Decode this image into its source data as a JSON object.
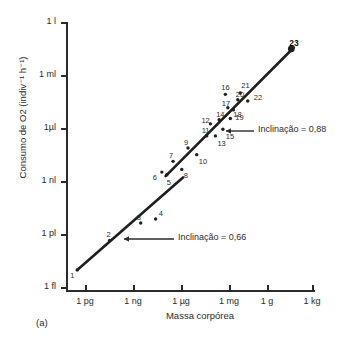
{
  "panel": {
    "label": "(a)"
  },
  "chart_data": {
    "type": "scatter",
    "title": "",
    "xlabel": "Massa corpórea",
    "ylabel": "Consumo de O2 (indiv⁻¹ h⁻¹)",
    "xscale": "log",
    "yscale": "log",
    "grid": false,
    "legend": "none",
    "xticklabels": [
      "1 pg",
      "1 ng",
      "1 µg",
      "1 mg",
      "1 g",
      "1 kg"
    ],
    "yticklabels": [
      "1 fl",
      "1 pl",
      "1 nl",
      "1µl",
      "1 ml",
      "1 l"
    ],
    "xlim": [
      "1 pg",
      "1 kg"
    ],
    "ylim": [
      "1 fl",
      "1 l"
    ],
    "points": [
      {
        "n": "1",
        "x": 0.045,
        "y": 0.075
      },
      {
        "n": "2",
        "x": 0.175,
        "y": 0.185
      },
      {
        "n": "3",
        "x": 0.3,
        "y": 0.25
      },
      {
        "n": "4",
        "x": 0.36,
        "y": 0.265
      },
      {
        "n": "5",
        "x": 0.405,
        "y": 0.43
      },
      {
        "n": "6",
        "x": 0.385,
        "y": 0.44
      },
      {
        "n": "7",
        "x": 0.43,
        "y": 0.48
      },
      {
        "n": "8",
        "x": 0.465,
        "y": 0.45
      },
      {
        "n": "9",
        "x": 0.49,
        "y": 0.53
      },
      {
        "n": "10",
        "x": 0.525,
        "y": 0.505
      },
      {
        "n": "11",
        "x": 0.565,
        "y": 0.575
      },
      {
        "n": "12",
        "x": 0.58,
        "y": 0.62
      },
      {
        "n": "13",
        "x": 0.6,
        "y": 0.575
      },
      {
        "n": "14",
        "x": 0.615,
        "y": 0.635
      },
      {
        "n": "15",
        "x": 0.63,
        "y": 0.6
      },
      {
        "n": "16",
        "x": 0.64,
        "y": 0.73
      },
      {
        "n": "17",
        "x": 0.65,
        "y": 0.68
      },
      {
        "n": "18",
        "x": 0.66,
        "y": 0.64
      },
      {
        "n": "19",
        "x": 0.672,
        "y": 0.672
      },
      {
        "n": "20",
        "x": 0.69,
        "y": 0.71
      },
      {
        "n": "21",
        "x": 0.7,
        "y": 0.735
      },
      {
        "n": "22",
        "x": 0.73,
        "y": 0.705
      },
      {
        "n": "23",
        "x": 0.905,
        "y": 0.9
      }
    ],
    "fits": [
      {
        "name": "lower-segment",
        "slope_label": "Inclinação = 0,66",
        "slope": 0.66,
        "x0": 0.045,
        "y0": 0.075,
        "x1": 0.47,
        "y1": 0.42
      },
      {
        "name": "upper-segment",
        "slope_label": "Inclinação = 0,88",
        "slope": 0.88,
        "x0": 0.4,
        "y0": 0.425,
        "x1": 0.915,
        "y1": 0.905
      }
    ],
    "annotations": [
      {
        "name": "slope-088",
        "text": "Inclinação = 0,88"
      },
      {
        "name": "slope-066",
        "text": "Inclinação = 0,66"
      }
    ]
  }
}
